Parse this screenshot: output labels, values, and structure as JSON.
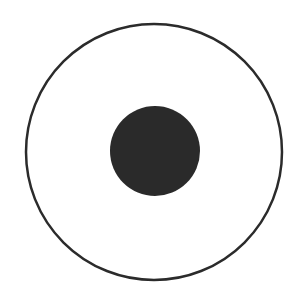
{
  "diagram": {
    "background": "#ffffff",
    "outer_circle": {
      "cx": 154,
      "cy": 152,
      "r": 128,
      "stroke": "#2b2b2b",
      "stroke_width": 2.5,
      "fill": "none"
    },
    "inner_disk": {
      "cx": 155,
      "cy": 151,
      "r": 45,
      "fill": "#2a2a2a"
    }
  }
}
